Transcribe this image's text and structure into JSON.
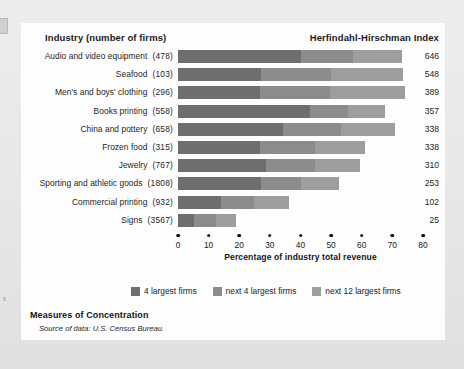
{
  "headers": {
    "industry": "Industry (number of firms)",
    "hhi": "Herfindahl-Hirschman Index"
  },
  "axis_title": "Percentage of industry total revenue",
  "legend": [
    {
      "label": "4 largest firms",
      "color": "#6e6e6e"
    },
    {
      "label": "next 4 largest firms",
      "color": "#8c8c8c"
    },
    {
      "label": "next 12 largest firms",
      "color": "#9d9d9d"
    }
  ],
  "footer": {
    "title": "Measures of Concentration",
    "source_label": "Source of data:",
    "source_value": "U.S. Census Bureau."
  },
  "chart_data": {
    "type": "bar",
    "subtype": "stacked-horizontal",
    "title": "Measures of Concentration",
    "xlabel": "Percentage of industry total revenue",
    "ylabel": "Industry (number of firms)",
    "xlim": [
      0,
      80
    ],
    "xticks": [
      0,
      10,
      20,
      30,
      40,
      50,
      60,
      70,
      80
    ],
    "grid": false,
    "legend_position": "bottom",
    "value_column_header": "Herfindahl-Hirschman Index",
    "categories": [
      "Audio and video equipment  (478)",
      "Seafood  (103)",
      "Men's and boys' clothing  (296)",
      "Books printing  (558)",
      "China and pottery  (658)",
      "Frozen food  (315)",
      "Jewelry  (767)",
      "Sporting and athletic goods  (1808)",
      "Commercial printing  (932)",
      "Signs  (3567)"
    ],
    "series": [
      {
        "name": "4 largest firms",
        "color": "#6e6e6e",
        "values": [
          40.3,
          27.0,
          26.7,
          43.0,
          34.3,
          26.7,
          28.7,
          27.0,
          13.9,
          5.3
        ]
      },
      {
        "name": "next 4 largest firms",
        "color": "#8c8c8c",
        "values": [
          17.0,
          23.0,
          23.0,
          12.5,
          19.0,
          18.0,
          16.0,
          13.0,
          11.0,
          7.0
        ]
      },
      {
        "name": "next 12 largest firms",
        "color": "#9d9d9d",
        "values": [
          16.0,
          23.4,
          24.4,
          12.2,
          17.7,
          16.3,
          14.7,
          12.5,
          11.4,
          6.8
        ]
      }
    ],
    "hhi_values": [
      646,
      548,
      389,
      357,
      338,
      338,
      310,
      253,
      102,
      25
    ]
  },
  "rows": [
    {
      "label": "Audio and video equipment",
      "firms": "(478)",
      "hhi": "646",
      "segments": [
        40.3,
        17.0,
        16.0
      ]
    },
    {
      "label": "Seafood",
      "firms": "(103)",
      "hhi": "548",
      "segments": [
        27.0,
        23.0,
        23.4
      ]
    },
    {
      "label": "Men's and boys' clothing",
      "firms": "(296)",
      "hhi": "389",
      "segments": [
        26.7,
        23.0,
        24.4
      ]
    },
    {
      "label": "Books printing",
      "firms": "(558)",
      "hhi": "357",
      "segments": [
        43.0,
        12.5,
        12.2
      ]
    },
    {
      "label": "China and pottery",
      "firms": "(658)",
      "hhi": "338",
      "segments": [
        34.3,
        19.0,
        17.7
      ]
    },
    {
      "label": "Frozen food",
      "firms": "(315)",
      "hhi": "338",
      "segments": [
        26.7,
        18.0,
        16.3
      ]
    },
    {
      "label": "Jewelry",
      "firms": "(767)",
      "hhi": "310",
      "segments": [
        28.7,
        16.0,
        14.7
      ]
    },
    {
      "label": "Sporting and athletic goods",
      "firms": "(1808)",
      "hhi": "253",
      "segments": [
        27.0,
        13.0,
        12.5
      ]
    },
    {
      "label": "Commercial printing",
      "firms": "(932)",
      "hhi": "102",
      "segments": [
        13.9,
        11.0,
        11.4
      ]
    },
    {
      "label": "Signs",
      "firms": "(3567)",
      "hhi": "25",
      "segments": [
        5.3,
        7.0,
        6.8
      ]
    }
  ]
}
